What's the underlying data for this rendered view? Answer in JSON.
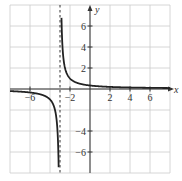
{
  "chart_data": {
    "type": "line",
    "title": "",
    "xlabel": "x",
    "ylabel": "y",
    "xlim": [
      -8,
      8
    ],
    "ylim": [
      -8,
      8
    ],
    "grid": true,
    "grid_step": 2,
    "x_ticks": [
      -6,
      -2,
      2,
      4,
      6
    ],
    "x_tick_labels": [
      "−6",
      "−2",
      "2",
      "4",
      "6"
    ],
    "y_ticks": [
      6,
      4,
      2,
      -4,
      -6
    ],
    "y_tick_labels": [
      "6",
      "4",
      "2",
      "−4",
      "−6"
    ],
    "function": "y = 1/(x+3)",
    "vertical_asymptote": -3,
    "horizontal_asymptote": 0,
    "series": [
      {
        "name": "f(x) = 1/(x+3)",
        "color": "#222222"
      }
    ],
    "asymptote_color": "#333333",
    "grid_color": "#cccccc",
    "axis_color": "#333333"
  }
}
